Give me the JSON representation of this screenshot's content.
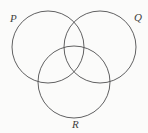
{
  "figure": {
    "kind": "venn-diagram-three-sets",
    "width": 148,
    "height": 133,
    "background_color": "#fbfbfa",
    "stroke_color": "#4f4f50"
  },
  "chart_data": {
    "type": "diagram",
    "title": "",
    "sets": [
      {
        "id": "P",
        "label": "P",
        "center_x": 48,
        "center_y": 47,
        "radius": 36,
        "label_x": 14,
        "label_y": 19,
        "label_position": "upper-left"
      },
      {
        "id": "Q",
        "label": "Q",
        "center_x": 100,
        "center_y": 47,
        "radius": 36,
        "label_x": 138,
        "label_y": 18,
        "label_position": "upper-right"
      },
      {
        "id": "R",
        "label": "R",
        "center_x": 74,
        "center_y": 82,
        "radius": 36,
        "label_x": 76,
        "label_y": 125,
        "label_position": "bottom-center"
      }
    ],
    "intersection_points": [
      {
        "sets": "P-Q",
        "x": 74,
        "y": 22
      },
      {
        "sets": "P-Q",
        "x": 74,
        "y": 72
      },
      {
        "sets": "P-R",
        "x": 40,
        "y": 83
      },
      {
        "sets": "Q-R",
        "x": 108,
        "y": 83
      }
    ],
    "regions": 7,
    "shaded": false,
    "legend": "none",
    "grid": false
  },
  "labels": {
    "p": "P",
    "q": "Q",
    "r": "R"
  }
}
